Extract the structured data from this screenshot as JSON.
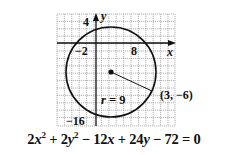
{
  "chart_data": {
    "type": "diagram",
    "title": "",
    "shape": "circle",
    "center": {
      "x": 3,
      "y": -6,
      "label": "(3, −6)"
    },
    "radius": 9,
    "radius_label": "r = 9",
    "axes": {
      "x_label": "x",
      "y_label": "y"
    },
    "tick_labels": {
      "x": [
        "−2",
        "8"
      ],
      "y": [
        "4",
        "−16"
      ]
    },
    "grid": true,
    "equation": "2x² + 2y² − 12x + 24y − 72 = 0"
  },
  "labels": {
    "y_axis": "y",
    "x_axis": "x",
    "y_top": "4",
    "x_neg": "−2",
    "x_pos": "8",
    "y_bottom": "−16",
    "radius": "r = 9",
    "point": "(3, −6)"
  },
  "equation_parts": {
    "t1": "2",
    "t1v": "x",
    "t1e": "2",
    "op1": " + 2",
    "t2v": "y",
    "t2e": "2",
    "op2": " − 12",
    "t3v": "x",
    "op3": " + 24",
    "t4v": "y",
    "op4": " − 72 = 0"
  },
  "colors": {
    "ink": "#111111",
    "grid": "#9a9a9a",
    "background": "#ffffff"
  }
}
